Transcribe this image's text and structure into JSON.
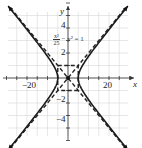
{
  "chart_data": {
    "type": "line",
    "title": "",
    "equation": "x^2/25 - y^2 = 1",
    "equation_display": {
      "numerator": "x²",
      "denominator": "25",
      "rest": "− y² = 1"
    },
    "xlabel": "x",
    "ylabel": "y",
    "xlim": [
      -30,
      30
    ],
    "ylim": [
      -7,
      6
    ],
    "x_ticks": [
      -20,
      20
    ],
    "x_tick_labels": [
      "−20",
      "20"
    ],
    "y_ticks": [
      4,
      2,
      -2,
      -4
    ],
    "y_tick_labels": [
      "4",
      "2",
      "−2",
      "−4"
    ],
    "grid": true,
    "series": [
      {
        "name": "hyperbola right branch",
        "style": "solid",
        "vertex": [
          5,
          0
        ]
      },
      {
        "name": "hyperbola left branch",
        "style": "solid",
        "vertex": [
          -5,
          0
        ]
      },
      {
        "name": "asymptote y = x/5",
        "style": "dashed",
        "slope": 0.2
      },
      {
        "name": "asymptote y = -x/5",
        "style": "dashed",
        "slope": -0.2
      },
      {
        "name": "central rectangle",
        "style": "dashed",
        "corners": [
          [
            -5,
            -1
          ],
          [
            5,
            1
          ]
        ]
      }
    ],
    "center": [
      0,
      0
    ],
    "a": 5,
    "b": 1
  },
  "colors": {
    "curve": "#1a1a1a",
    "grid": "#d0d0d0",
    "axis": "#333333"
  }
}
